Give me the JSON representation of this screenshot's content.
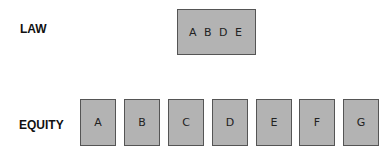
{
  "law": {
    "label": "LAW",
    "box_text": "A B D E"
  },
  "equity": {
    "label": "EQUITY",
    "boxes": [
      "A",
      "B",
      "C",
      "D",
      "E",
      "F",
      "G"
    ]
  },
  "colors": {
    "box_fill": "#b3b3b3",
    "box_border": "#555555",
    "text": "#111111"
  }
}
